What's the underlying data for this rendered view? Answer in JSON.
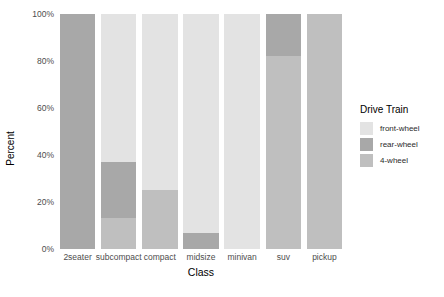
{
  "chart_data": {
    "type": "bar",
    "title": "",
    "subtitle": "",
    "xlabel": "Class",
    "ylabel": "Percent",
    "stacked": true,
    "stack_mode": "percent",
    "grid": false,
    "legend_position": "right",
    "legend_title": "Drive Train",
    "ylim": [
      0,
      100
    ],
    "yticks": [
      0,
      20,
      40,
      60,
      80,
      100
    ],
    "ytick_labels": [
      "0%",
      "20%",
      "40%",
      "60%",
      "80%",
      "100%"
    ],
    "categories": [
      "2seater",
      "subcompact",
      "compact",
      "midsize",
      "minivan",
      "suv",
      "pickup"
    ],
    "series": [
      {
        "name": "front-wheel",
        "color": "#e3e3e3",
        "values": [
          0,
          63,
          75,
          93,
          100,
          0,
          0
        ]
      },
      {
        "name": "rear-wheel",
        "color": "#a8a8a8",
        "values": [
          100,
          24,
          0,
          7,
          0,
          18,
          0
        ]
      },
      {
        "name": "4-wheel",
        "color": "#bfbfbf",
        "values": [
          0,
          13,
          25,
          0,
          0,
          82,
          100
        ]
      }
    ],
    "stack_order_bottom_to_top": [
      "4-wheel",
      "rear-wheel",
      "front-wheel"
    ]
  },
  "axes": {
    "y_title": "Percent",
    "x_title": "Class",
    "y_tick_labels": [
      "100%",
      "80%",
      "60%",
      "40%",
      "20%",
      "0%"
    ],
    "x_tick_labels": [
      "2seater",
      "subcompact",
      "compact",
      "midsize",
      "minivan",
      "suv",
      "pickup"
    ]
  },
  "legend": {
    "title": "Drive Train",
    "items": [
      {
        "label": "front-wheel",
        "color": "#e3e3e3"
      },
      {
        "label": "rear-wheel",
        "color": "#a8a8a8"
      },
      {
        "label": "4-wheel",
        "color": "#bfbfbf"
      }
    ]
  },
  "colors": {
    "background": "#ffffff",
    "tick_text": "#4d4d4d",
    "title_text": "#000000"
  }
}
